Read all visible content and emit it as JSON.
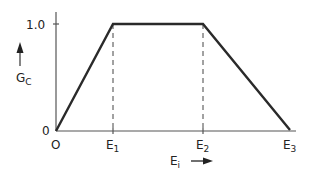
{
  "diagram": {
    "y_axis": {
      "label_main": "G",
      "label_sub": "C",
      "tick_label_top": "1.0",
      "tick_label_origin": "0"
    },
    "x_axis": {
      "label_main": "E",
      "label_sub": "i",
      "origin_label": "O",
      "ticks": [
        {
          "main": "E",
          "sub": "1"
        },
        {
          "main": "E",
          "sub": "2"
        },
        {
          "main": "E",
          "sub": "3"
        }
      ]
    },
    "curve": {
      "shape": "trapezoid",
      "points": [
        {
          "x": "O",
          "y": 0
        },
        {
          "x": "E1",
          "y": 1.0
        },
        {
          "x": "E2",
          "y": 1.0
        },
        {
          "x": "E3",
          "y": 0
        }
      ]
    },
    "colors": {
      "line": "#2a2a2a",
      "axis": "#555555"
    }
  }
}
